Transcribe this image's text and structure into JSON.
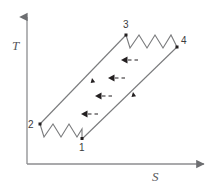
{
  "figure": {
    "background_color": "#ffffff",
    "line_color": "#6d6e71",
    "marker_color": "#231f20",
    "label_color": "#3b3b3d",
    "axis_label_color": "#58595b"
  },
  "axes": {
    "y": {
      "label": "T",
      "name": "temperature-axis",
      "x": 27,
      "top": 14,
      "bottom": 164,
      "arrow": "up"
    },
    "x": {
      "label": "S",
      "name": "entropy-axis",
      "y": 164,
      "left": 27,
      "right": 207,
      "arrow": "right"
    }
  },
  "states": [
    {
      "id": "1",
      "label": "1",
      "x": 82,
      "y": 139
    },
    {
      "id": "2",
      "label": "2",
      "x": 40,
      "y": 124
    },
    {
      "id": "3",
      "label": "3",
      "x": 126,
      "y": 35
    },
    {
      "id": "4",
      "label": "4",
      "x": 177,
      "y": 47
    }
  ],
  "process_legs": [
    {
      "name": "leg-2-3",
      "from": "2",
      "to": "3",
      "style": "solid-line",
      "direction_marker": {
        "x": 92,
        "y": 78,
        "points": "up-right"
      }
    },
    {
      "name": "leg-1-4",
      "from": "1",
      "to": "4",
      "style": "solid-line",
      "direction_marker": {
        "x": 133,
        "y": 92,
        "points": "up-right"
      }
    },
    {
      "name": "leg-2-1",
      "from": "2",
      "to": "1",
      "style": "zigzag",
      "peaks": 3
    },
    {
      "name": "leg-3-4",
      "from": "3",
      "to": "4",
      "style": "zigzag",
      "peaks": 4
    }
  ],
  "heat_arrows": [
    {
      "name": "heat-arrow-1",
      "x": 121,
      "y": 60,
      "direction": "left"
    },
    {
      "name": "heat-arrow-2",
      "x": 108,
      "y": 78,
      "direction": "left"
    },
    {
      "name": "heat-arrow-3",
      "x": 95,
      "y": 96,
      "direction": "left"
    },
    {
      "name": "heat-arrow-4",
      "x": 81,
      "y": 114,
      "direction": "left"
    }
  ]
}
